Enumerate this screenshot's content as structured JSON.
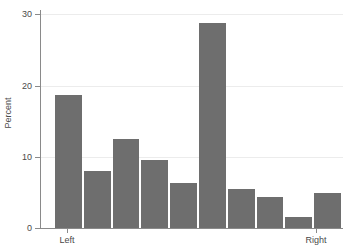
{
  "chart_data": {
    "type": "bar",
    "title": "",
    "subtitle": "",
    "xlabel": "",
    "ylabel": "Percent",
    "ylim": [
      0,
      30
    ],
    "yticks": [
      0,
      10,
      20,
      30
    ],
    "ytick_labels": [
      "0",
      "10",
      "20",
      "30"
    ],
    "grid": true,
    "legend": false,
    "legend_position": "none",
    "bar_color": "#6e6e6e",
    "axis_color": "#8a8a8a",
    "gridline_color": "#ececec",
    "categories": [
      "1",
      "2",
      "3",
      "4",
      "5",
      "6",
      "7",
      "8",
      "9",
      "10"
    ],
    "values": [
      18.6,
      8.0,
      12.5,
      9.6,
      6.3,
      28.8,
      5.5,
      4.3,
      1.5,
      4.9
    ],
    "xtick_labels": [
      {
        "label": "Left",
        "category_index": 0
      },
      {
        "label": "Right",
        "category_index": 9
      }
    ],
    "annotations": []
  }
}
